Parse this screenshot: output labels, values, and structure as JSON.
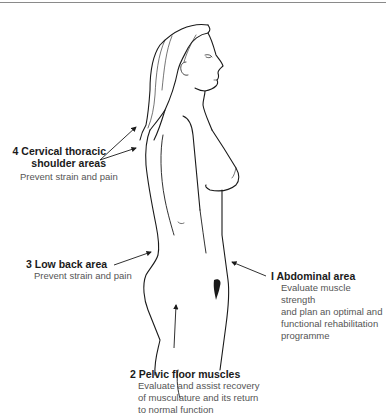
{
  "diagram": {
    "annotations": [
      {
        "number": "1",
        "title": "Abdominal area",
        "description": [
          "Evaluate muscle strength",
          "and plan an optimal and",
          "functional rehabilitation",
          "programme"
        ]
      },
      {
        "number": "2",
        "title": "Pelvic floor muscles",
        "description": [
          "Evaluate and assist recovery",
          "of musculature and its return",
          "to normal function"
        ]
      },
      {
        "number": "3",
        "title": "Low back area",
        "description": [
          "Prevent strain and pain"
        ]
      },
      {
        "number": "4",
        "title": [
          "Cervical thoracic",
          "shoulder areas"
        ],
        "description": [
          "Prevent strain and pain"
        ]
      }
    ]
  },
  "labels": {
    "a1_title": "I  Abdominal area",
    "a1_d1": "Evaluate muscle strength",
    "a1_d2": "and plan an optimal and",
    "a1_d3": "functional rehabilitation",
    "a1_d4": "programme",
    "a2_title": "2 Pelvic floor muscles",
    "a2_d1": "Evaluate and assist recovery",
    "a2_d2": "of musculature and its return",
    "a2_d3": "to normal function",
    "a3_title": "3 Low back area",
    "a3_d1": "Prevent strain and pain",
    "a4_title1": "4 Cervical thoracic",
    "a4_title2": "shoulder areas",
    "a4_d1": "Prevent strain and pain"
  },
  "colors": {
    "line": "#1a1a1a",
    "text_title": "#1a1a1a",
    "text_desc": "#555555",
    "rule": "#8a8a8a"
  }
}
